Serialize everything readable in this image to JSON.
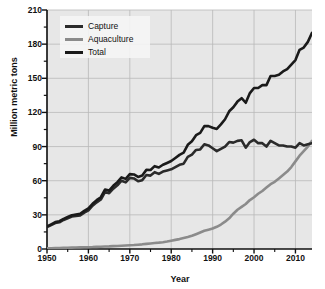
{
  "chart_data": {
    "type": "line",
    "title": "",
    "subtitle": "",
    "xlabel": "Year",
    "ylabel": "Million metric tons",
    "xlim": [
      1950,
      2014
    ],
    "ylim": [
      0,
      210
    ],
    "yticks": [
      0,
      30,
      60,
      90,
      120,
      150,
      180,
      210
    ],
    "xticks": [
      1950,
      1960,
      1970,
      1980,
      1990,
      2000,
      2010
    ],
    "xtick_labels": [
      "1950",
      "1960",
      "1970",
      "1980",
      "1990",
      "2000",
      "2010"
    ],
    "ytick_labels": [
      "0",
      "30",
      "60",
      "90",
      "120",
      "150",
      "180",
      "210"
    ],
    "grid": true,
    "legend_position": "top-left",
    "plot_background": "#e7e7e7",
    "grid_color": "#b9b9b9",
    "x": [
      1950,
      1951,
      1952,
      1953,
      1954,
      1955,
      1956,
      1957,
      1958,
      1959,
      1960,
      1961,
      1962,
      1963,
      1964,
      1965,
      1966,
      1967,
      1968,
      1969,
      1970,
      1971,
      1972,
      1973,
      1974,
      1975,
      1976,
      1977,
      1978,
      1979,
      1980,
      1981,
      1982,
      1983,
      1984,
      1985,
      1986,
      1987,
      1988,
      1989,
      1990,
      1991,
      1992,
      1993,
      1994,
      1995,
      1996,
      1997,
      1998,
      1999,
      2000,
      2001,
      2002,
      2003,
      2004,
      2005,
      2006,
      2007,
      2008,
      2009,
      2010,
      2011,
      2012,
      2013,
      2014
    ],
    "series": [
      {
        "name": "Capture",
        "color": "#2b2b2b",
        "values": [
          19.3,
          21.0,
          22.8,
          23.5,
          25.5,
          27.0,
          28.5,
          29.0,
          29.5,
          32.0,
          34.0,
          38.0,
          41.0,
          43.5,
          50.0,
          49.0,
          53.0,
          56.0,
          60.0,
          58.5,
          62.5,
          62.0,
          59.5,
          60.5,
          65.0,
          64.5,
          67.5,
          66.0,
          68.0,
          69.0,
          70.0,
          72.0,
          74.0,
          75.0,
          81.0,
          83.0,
          87.0,
          87.5,
          92.0,
          91.0,
          88.5,
          86.0,
          88.0,
          90.0,
          94.0,
          93.5,
          95.0,
          95.5,
          89.0,
          94.0,
          96.0,
          93.0,
          93.0,
          90.0,
          95.0,
          93.0,
          91.0,
          91.0,
          90.0,
          90.0,
          89.0,
          93.0,
          91.0,
          92.0,
          93.0
        ]
      },
      {
        "name": "Aquaculture",
        "color": "#8b8b8b",
        "values": [
          0.6,
          0.7,
          0.8,
          0.9,
          1.0,
          1.1,
          1.2,
          1.3,
          1.4,
          1.5,
          1.6,
          1.7,
          1.9,
          2.0,
          2.2,
          2.3,
          2.5,
          2.7,
          2.9,
          3.1,
          3.3,
          3.5,
          3.8,
          4.1,
          4.5,
          4.9,
          5.3,
          5.6,
          6.0,
          6.6,
          7.3,
          8.0,
          8.7,
          9.6,
          10.5,
          11.6,
          13.0,
          14.5,
          16.0,
          17.0,
          18.0,
          19.5,
          21.5,
          24.0,
          27.0,
          31.0,
          34.5,
          37.0,
          39.5,
          43.0,
          45.5,
          48.5,
          51.0,
          54.0,
          57.0,
          59.0,
          62.0,
          65.0,
          68.0,
          72.0,
          77.0,
          82.0,
          86.0,
          90.0,
          95.0
        ]
      },
      {
        "name": "Total",
        "color": "#1a1a1a",
        "values": [
          19.9,
          21.7,
          23.6,
          24.4,
          26.5,
          28.1,
          29.7,
          30.3,
          30.9,
          33.5,
          35.6,
          39.7,
          42.9,
          45.5,
          52.2,
          51.3,
          55.5,
          58.7,
          62.9,
          61.6,
          65.8,
          65.5,
          63.3,
          64.6,
          69.5,
          69.4,
          72.8,
          71.6,
          74.0,
          75.6,
          77.3,
          80.0,
          82.7,
          84.6,
          91.5,
          94.6,
          100.0,
          102.0,
          108.0,
          108.0,
          106.5,
          105.5,
          109.5,
          114.0,
          121.0,
          124.5,
          129.5,
          132.5,
          128.5,
          137.0,
          141.5,
          141.5,
          144.0,
          144.0,
          152.0,
          152.0,
          153.0,
          156.0,
          158.0,
          162.0,
          166.0,
          175.0,
          177.0,
          182.0,
          190.0
        ]
      }
    ]
  },
  "legend": {
    "items": [
      {
        "label": "Capture",
        "color": "#2b2b2b"
      },
      {
        "label": "Aquaculture",
        "color": "#8b8b8b"
      },
      {
        "label": "Total",
        "color": "#1a1a1a"
      }
    ]
  }
}
